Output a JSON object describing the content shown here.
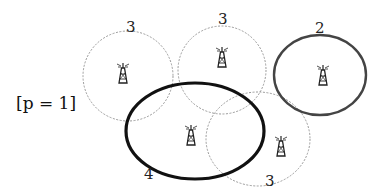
{
  "diagram": {
    "parameter_label": "[p = 1]",
    "cells": [
      {
        "id": "cell-top-left",
        "label": "3",
        "style": "dashed",
        "color": "#9a9a9a"
      },
      {
        "id": "cell-top-middle",
        "label": "3",
        "style": "dashed",
        "color": "#9a9a9a"
      },
      {
        "id": "cell-right",
        "label": "2",
        "style": "solid",
        "color": "#444444"
      },
      {
        "id": "cell-center",
        "label": "4",
        "style": "solid-bold",
        "color": "#111111"
      },
      {
        "id": "cell-bottom-right",
        "label": "3",
        "style": "dashed",
        "color": "#9a9a9a"
      }
    ],
    "icon": "cell-tower-icon"
  }
}
